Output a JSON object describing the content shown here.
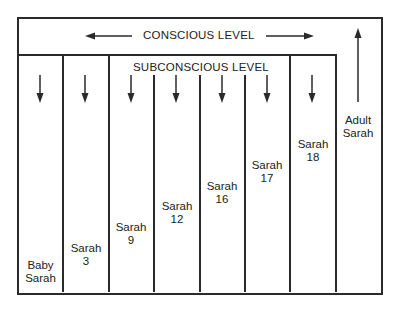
{
  "diagram": {
    "conscious_label": "CONSCIOUS LEVEL",
    "subconscious_label": "SUBCONSCIOUS LEVEL",
    "columns": [
      {
        "line1": "Baby",
        "line2": "Sarah"
      },
      {
        "line1": "Sarah",
        "line2": "3"
      },
      {
        "line1": "Sarah",
        "line2": "9"
      },
      {
        "line1": "Sarah",
        "line2": "12"
      },
      {
        "line1": "Sarah",
        "line2": "16"
      },
      {
        "line1": "Sarah",
        "line2": "17"
      },
      {
        "line1": "Sarah",
        "line2": "18"
      }
    ],
    "adult": {
      "line1": "Adult",
      "line2": "Sarah"
    },
    "colors": {
      "line": "#2a2a2a",
      "background": "#ffffff"
    }
  }
}
